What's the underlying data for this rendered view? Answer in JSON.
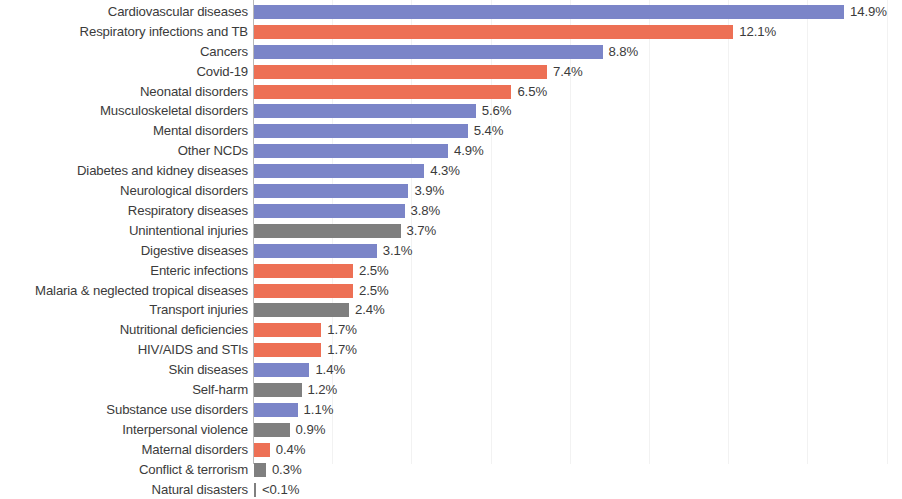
{
  "chart_data": {
    "type": "bar",
    "orientation": "horizontal",
    "title": "",
    "subtitle": "",
    "xlabel": "",
    "ylabel": "",
    "xlim": [
      0,
      16
    ],
    "grid": true,
    "gridline_interval": 2,
    "gridline_values": [
      2,
      4,
      6,
      8,
      10,
      12,
      14,
      16
    ],
    "legend": [],
    "legend_position": "none",
    "categories": [
      "Cardiovascular diseases",
      "Respiratory infections and TB",
      "Cancers",
      "Covid-19",
      "Neonatal disorders",
      "Musculoskeletal disorders",
      "Mental disorders",
      "Other NCDs",
      "Diabetes and kidney diseases",
      "Neurological disorders",
      "Respiratory diseases",
      "Unintentional injuries",
      "Digestive diseases",
      "Enteric infections",
      "Malaria & neglected tropical diseases",
      "Transport injuries",
      "Nutritional deficiencies",
      "HIV/AIDS and STIs",
      "Skin diseases",
      "Self-harm",
      "Substance use disorders",
      "Interpersonal violence",
      "Maternal disorders",
      "Conflict & terrorism",
      "Natural disasters"
    ],
    "values": [
      14.9,
      12.1,
      8.8,
      7.4,
      6.5,
      5.6,
      5.4,
      4.9,
      4.3,
      3.9,
      3.8,
      3.7,
      3.1,
      2.5,
      2.5,
      2.4,
      1.7,
      1.7,
      1.4,
      1.2,
      1.1,
      0.9,
      0.4,
      0.3,
      0.05
    ],
    "value_labels": [
      "14.9%",
      "12.1%",
      "8.8%",
      "7.4%",
      "6.5%",
      "5.6%",
      "5.4%",
      "4.9%",
      "4.3%",
      "3.9%",
      "3.8%",
      "3.7%",
      "3.1%",
      "2.5%",
      "2.5%",
      "2.4%",
      "1.7%",
      "1.7%",
      "1.4%",
      "1.2%",
      "1.1%",
      "0.9%",
      "0.4%",
      "0.3%",
      "<0.1%"
    ],
    "groups": [
      "ncd",
      "comm",
      "ncd",
      "comm",
      "comm",
      "ncd",
      "ncd",
      "ncd",
      "ncd",
      "ncd",
      "ncd",
      "injury",
      "ncd",
      "comm",
      "comm",
      "injury",
      "comm",
      "comm",
      "ncd",
      "injury",
      "ncd",
      "injury",
      "comm",
      "injury",
      "injury"
    ],
    "colors": {
      "ncd": "#7b85c8",
      "comm": "#ed7055",
      "injury": "#7f7f7f",
      "text": "#3b3b3b",
      "gridline": "#f2f2f2",
      "axis": "#b9b9b9",
      "background": "#ffffff"
    }
  }
}
